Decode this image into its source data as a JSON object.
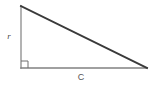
{
  "figure": {
    "name": "right-triangle",
    "background_color": "#ffffff",
    "width": 158,
    "height": 85
  },
  "labels": {
    "vertical_leg": "r",
    "horizontal_leg": "C"
  },
  "geometry": {
    "vertices": {
      "top": {
        "x": 21,
        "y": 6
      },
      "corner": {
        "x": 21,
        "y": 68
      },
      "right": {
        "x": 147,
        "y": 68
      }
    },
    "right_angle_marker": {
      "x": 21,
      "y": 68,
      "size": 7
    }
  },
  "colors": {
    "hypotenuse": "#3a3a3a",
    "vertical_leg": "#8a8a8a",
    "horizontal_leg": "#808080",
    "right_angle_marker": "#6e6e6e",
    "label_vertical": "#4a4a4a",
    "label_horizontal": "#555555"
  },
  "strokes": {
    "hypotenuse_width": 1.9,
    "vertical_leg_width": 1.3,
    "horizontal_leg_width": 1.5,
    "right_angle_width": 1
  },
  "label_positions": {
    "vertical_leg": {
      "x": 9,
      "y": 39
    },
    "horizontal_leg": {
      "x": 81,
      "y": 80
    }
  }
}
